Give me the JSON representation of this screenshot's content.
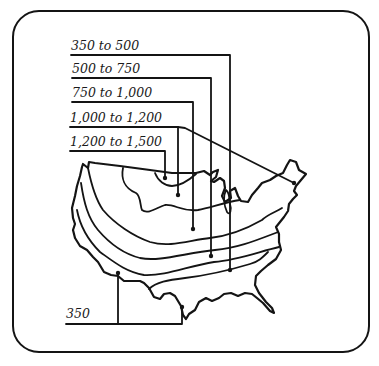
{
  "figure": {
    "type": "map-diagram",
    "colors": {
      "ink": "#141414",
      "background": "#ffffff"
    }
  },
  "labels": [
    {
      "id": "zone-350-500",
      "text": "350 to 500"
    },
    {
      "id": "zone-500-750",
      "text": "500 to 750"
    },
    {
      "id": "zone-750-1000",
      "text": "750 to 1,000"
    },
    {
      "id": "zone-1000-1200",
      "text": "1,000 to 1,200"
    },
    {
      "id": "zone-1200-1500",
      "text": "1,200 to 1,500"
    },
    {
      "id": "zone-350",
      "text": "350"
    }
  ]
}
